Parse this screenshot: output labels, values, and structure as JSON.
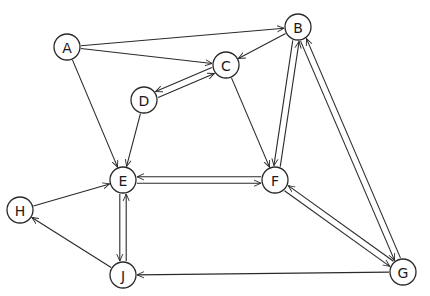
{
  "diagram": {
    "type": "directed-graph",
    "nodes": [
      {
        "id": "A",
        "label": "A",
        "x": 67,
        "y": 47
      },
      {
        "id": "B",
        "label": "B",
        "x": 298,
        "y": 27
      },
      {
        "id": "C",
        "label": "C",
        "x": 226,
        "y": 65
      },
      {
        "id": "D",
        "label": "D",
        "x": 144,
        "y": 100
      },
      {
        "id": "E",
        "label": "E",
        "x": 123,
        "y": 180
      },
      {
        "id": "F",
        "label": "F",
        "x": 275,
        "y": 180
      },
      {
        "id": "G",
        "label": "G",
        "x": 403,
        "y": 272
      },
      {
        "id": "H",
        "label": "H",
        "x": 20,
        "y": 210
      },
      {
        "id": "J",
        "label": "J",
        "x": 123,
        "y": 275
      }
    ],
    "edges": [
      {
        "from": "A",
        "to": "B"
      },
      {
        "from": "A",
        "to": "C"
      },
      {
        "from": "A",
        "to": "E"
      },
      {
        "from": "B",
        "to": "C"
      },
      {
        "from": "D",
        "to": "C"
      },
      {
        "from": "C",
        "to": "D"
      },
      {
        "from": "D",
        "to": "E"
      },
      {
        "from": "C",
        "to": "F"
      },
      {
        "from": "B",
        "to": "F"
      },
      {
        "from": "F",
        "to": "B"
      },
      {
        "from": "B",
        "to": "G"
      },
      {
        "from": "G",
        "to": "B"
      },
      {
        "from": "E",
        "to": "F"
      },
      {
        "from": "F",
        "to": "E"
      },
      {
        "from": "F",
        "to": "G"
      },
      {
        "from": "G",
        "to": "F"
      },
      {
        "from": "E",
        "to": "J"
      },
      {
        "from": "J",
        "to": "E"
      },
      {
        "from": "H",
        "to": "E"
      },
      {
        "from": "J",
        "to": "H"
      },
      {
        "from": "G",
        "to": "J"
      }
    ],
    "node_radius": 13,
    "colors": {
      "stroke": "#2a2a2a",
      "background": "#ffffff"
    }
  }
}
